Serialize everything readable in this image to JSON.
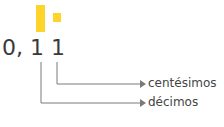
{
  "diagram": {
    "number_text": "0, 1 1",
    "labels": {
      "hundredths": "centésimos",
      "tenths": "décimos"
    },
    "colors": {
      "highlight": "#ffd42a",
      "line": "#7a7a7a"
    },
    "icons": [
      "tall-bar-tenths",
      "small-square-hundredths",
      "arrow-right-icon"
    ]
  }
}
